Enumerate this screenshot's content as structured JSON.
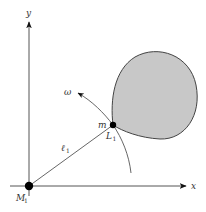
{
  "diagram": {
    "type": "physics-orbit-diagram",
    "colors": {
      "axis": "#555555",
      "line": "#555555",
      "region_fill": "#c8c8c8",
      "region_stroke": "#444444",
      "point": "#000000",
      "text": "#333333"
    },
    "axes": {
      "x_label": "x",
      "y_label": "y"
    },
    "points": {
      "origin": {
        "label": "M",
        "subscript": "1"
      },
      "lagrange": {
        "label": "L",
        "subscript": "1",
        "mass_label": "m"
      }
    },
    "segment": {
      "label": "ℓ",
      "subscript": "1"
    },
    "rotation": {
      "label": "ω"
    },
    "region": {
      "description": "shaded teardrop-shaped region attached at L1"
    }
  }
}
